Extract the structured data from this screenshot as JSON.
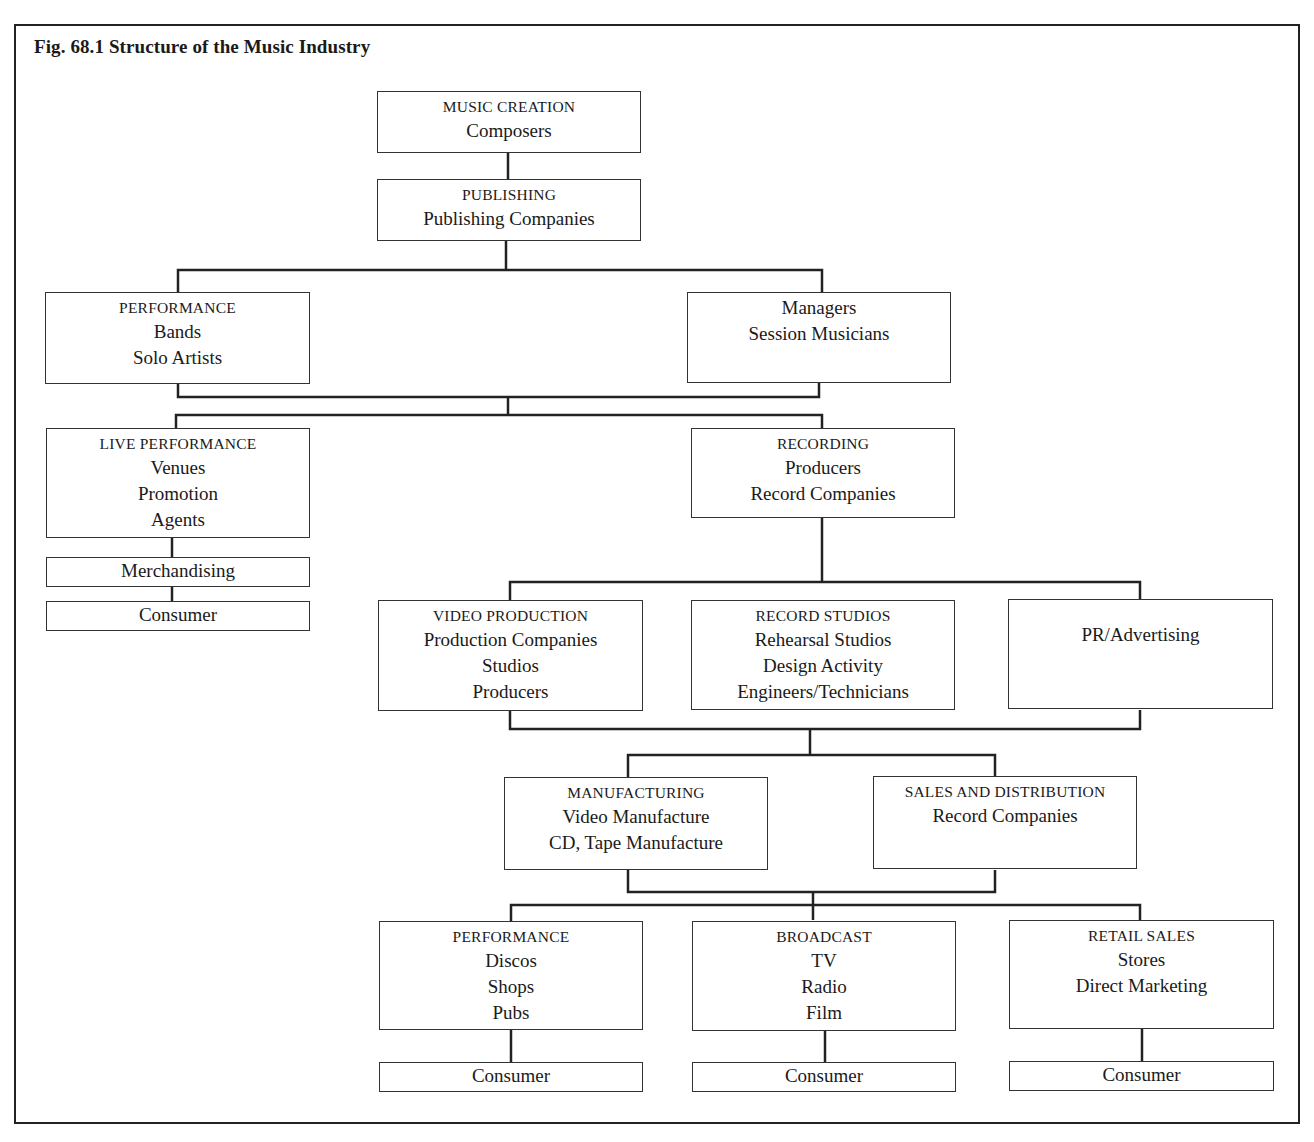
{
  "title": "Fig. 68.1 Structure of the Music Industry",
  "nodes": {
    "music_creation": {
      "heading": "MUSIC CREATION",
      "items": [
        "Composers"
      ]
    },
    "publishing": {
      "heading": "PUBLISHING",
      "items": [
        "Publishing Companies"
      ]
    },
    "performance_artists": {
      "heading": "PERFORMANCE",
      "items": [
        "Bands",
        "Solo Artists"
      ]
    },
    "managers": {
      "heading": "",
      "items": [
        "Managers",
        "Session Musicians"
      ]
    },
    "live_performance": {
      "heading": "LIVE PERFORMANCE",
      "items": [
        "Venues",
        "Promotion",
        "Agents"
      ]
    },
    "merchandising": {
      "heading": "",
      "items": [
        "Merchandising"
      ]
    },
    "consumer_live": {
      "heading": "",
      "items": [
        "Consumer"
      ]
    },
    "recording": {
      "heading": "RECORDING",
      "items": [
        "Producers",
        "Record Companies"
      ]
    },
    "video_production": {
      "heading": "VIDEO PRODUCTION",
      "items": [
        "Production Companies",
        "Studios",
        "Producers"
      ]
    },
    "record_studios": {
      "heading": "RECORD STUDIOS",
      "items": [
        "Rehearsal Studios",
        "Design Activity",
        "Engineers/Technicians"
      ]
    },
    "pr_advertising": {
      "heading": "",
      "items": [
        "PR/Advertising"
      ]
    },
    "manufacturing": {
      "heading": "MANUFACTURING",
      "items": [
        "Video Manufacture",
        "CD, Tape Manufacture"
      ]
    },
    "sales_distribution": {
      "heading": "SALES AND DISTRIBUTION",
      "items": [
        "Record Companies"
      ]
    },
    "performance_venues": {
      "heading": "PERFORMANCE",
      "items": [
        "Discos",
        "Shops",
        "Pubs"
      ]
    },
    "broadcast": {
      "heading": "BROADCAST",
      "items": [
        "TV",
        "Radio",
        "Film"
      ]
    },
    "retail_sales": {
      "heading": "RETAIL SALES",
      "items": [
        "Stores",
        "Direct Marketing"
      ]
    },
    "consumer_performance": {
      "heading": "",
      "items": [
        "Consumer"
      ]
    },
    "consumer_broadcast": {
      "heading": "",
      "items": [
        "Consumer"
      ]
    },
    "consumer_retail": {
      "heading": "",
      "items": [
        "Consumer"
      ]
    }
  },
  "edges": [
    [
      "music_creation",
      "publishing"
    ],
    [
      "publishing",
      "performance_artists"
    ],
    [
      "publishing",
      "managers"
    ],
    [
      "performance_artists",
      "live_performance"
    ],
    [
      "performance_artists",
      "recording"
    ],
    [
      "managers",
      "live_performance"
    ],
    [
      "managers",
      "recording"
    ],
    [
      "live_performance",
      "merchandising"
    ],
    [
      "merchandising",
      "consumer_live"
    ],
    [
      "recording",
      "video_production"
    ],
    [
      "recording",
      "record_studios"
    ],
    [
      "recording",
      "pr_advertising"
    ],
    [
      "video_production",
      "manufacturing"
    ],
    [
      "video_production",
      "sales_distribution"
    ],
    [
      "pr_advertising",
      "manufacturing"
    ],
    [
      "pr_advertising",
      "sales_distribution"
    ],
    [
      "manufacturing",
      "performance_venues"
    ],
    [
      "manufacturing",
      "broadcast"
    ],
    [
      "manufacturing",
      "retail_sales"
    ],
    [
      "sales_distribution",
      "performance_venues"
    ],
    [
      "sales_distribution",
      "broadcast"
    ],
    [
      "sales_distribution",
      "retail_sales"
    ],
    [
      "performance_venues",
      "consumer_performance"
    ],
    [
      "broadcast",
      "consumer_broadcast"
    ],
    [
      "retail_sales",
      "consumer_retail"
    ]
  ]
}
